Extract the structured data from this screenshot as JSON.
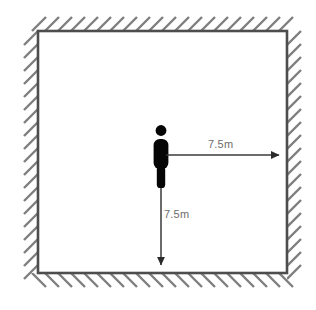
{
  "diagram": {
    "type": "floor-plan-distance-diagram",
    "title": "",
    "room": {
      "shape": "square",
      "walls": [
        "top",
        "right",
        "bottom",
        "left"
      ],
      "hatch_style": "45-degree-exterior-hatching",
      "wall_color": "#4d4d4d",
      "hatch_color": "#808080",
      "interior_color": "#ffffff"
    },
    "occupant": {
      "icon": "person-icon",
      "color": "#000000",
      "position_label": ""
    },
    "dimensions": [
      {
        "name": "horizontal-distance",
        "label": "7.5m",
        "value": 7.5,
        "unit": "m",
        "direction": "right",
        "from": "person",
        "to": "right-wall",
        "line_color": "#3a3a3a"
      },
      {
        "name": "vertical-distance",
        "label": "7.5m",
        "value": 7.5,
        "unit": "m",
        "direction": "down",
        "from": "person",
        "to": "bottom-wall",
        "line_color": "#3a3a3a"
      }
    ]
  }
}
